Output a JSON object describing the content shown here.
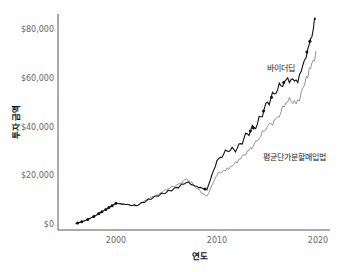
{
  "chart_data": {
    "type": "line",
    "title": "",
    "xlabel": "연도",
    "ylabel": "투자 금액",
    "x_ticks": [
      "2000",
      "2010",
      "2020"
    ],
    "y_ticks": [
      "$0",
      "$20,000",
      "$40,000",
      "$60,000",
      "$80,000"
    ],
    "xlim": [
      1994.5,
      2021
    ],
    "ylim": [
      0,
      85000
    ],
    "grid": false,
    "legend": "inline labels",
    "x": [
      1996,
      1997,
      1998,
      1999,
      2000,
      2001,
      2002,
      2003,
      2004,
      2005,
      2006,
      2007,
      2008,
      2009,
      2010,
      2011,
      2012,
      2013,
      2014,
      2015,
      2016,
      2017,
      2018,
      2019,
      2019.8
    ],
    "series": [
      {
        "name": "바이더딥",
        "color": "#111111",
        "values": [
          100,
          1500,
          3500,
          6000,
          8500,
          8000,
          7500,
          9500,
          11500,
          13000,
          15000,
          17000,
          15500,
          14000,
          26000,
          30000,
          31000,
          37000,
          41000,
          50000,
          55000,
          60000,
          58000,
          72000,
          84000
        ]
      },
      {
        "name": "평균단가분할매입법",
        "color": "#888888",
        "values": [
          100,
          1500,
          3500,
          6000,
          8500,
          8000,
          7500,
          9800,
          12000,
          14000,
          16000,
          18500,
          14500,
          11500,
          20000,
          23000,
          25000,
          30000,
          34000,
          40000,
          44000,
          50000,
          51000,
          60000,
          71000
        ]
      }
    ],
    "annotations": [
      {
        "text": "바이더딥",
        "x": 2016.5,
        "y": 58000
      },
      {
        "text": "평균단가분할매입법",
        "x": 2016,
        "y": 28000
      }
    ]
  }
}
